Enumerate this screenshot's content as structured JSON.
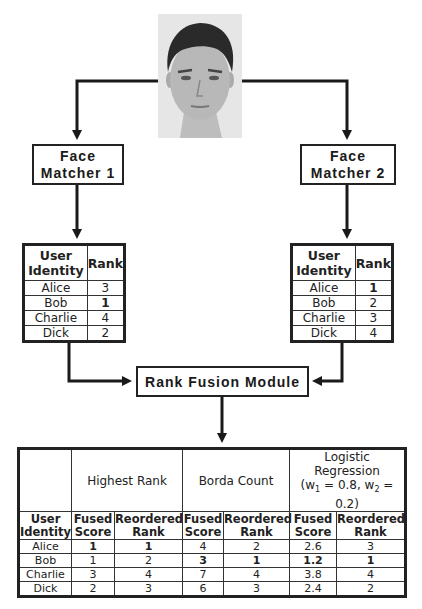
{
  "diagram": {
    "input_image": {
      "label": "face-photo",
      "description": "Grayscale frontal face photo of a young man"
    },
    "matchers": [
      {
        "line1": "Face",
        "line2": "Matcher 1"
      },
      {
        "line1": "Face",
        "line2": "Matcher 2"
      }
    ],
    "fusion_module": {
      "label": "Rank Fusion Module"
    },
    "matcher_tables": [
      {
        "headers": {
          "identity_line1": "User",
          "identity_line2": "Identity",
          "rank": "Rank"
        },
        "rows": [
          {
            "name": "Alice",
            "rank": "3"
          },
          {
            "name": "Bob",
            "rank": "1"
          },
          {
            "name": "Charlie",
            "rank": "4"
          },
          {
            "name": "Dick",
            "rank": "2"
          }
        ]
      },
      {
        "headers": {
          "identity_line1": "User",
          "identity_line2": "Identity",
          "rank": "Rank"
        },
        "rows": [
          {
            "name": "Alice",
            "rank": "1"
          },
          {
            "name": "Bob",
            "rank": "2"
          },
          {
            "name": "Charlie",
            "rank": "3"
          },
          {
            "name": "Dick",
            "rank": "4"
          }
        ]
      }
    ],
    "fusion_table": {
      "groups": [
        {
          "label": "Highest Rank"
        },
        {
          "label": "Borda Count"
        },
        {
          "label": "Logistic Regression",
          "weights_prefix": "(w",
          "w1_sub": "1",
          "w1_val": " = 0.8, w",
          "w2_sub": "2",
          "w2_val": " = 0.2)"
        }
      ],
      "subheaders": {
        "identity_line1": "User",
        "identity_line2": "Identity",
        "fused_line1": "Fused",
        "fused_line2": "Score",
        "reordered_line1": "Reordered",
        "reordered_line2": "Rank"
      },
      "rows": [
        {
          "name": "Alice",
          "hr_fused": "1",
          "hr_rank": "1",
          "bc_fused": "4",
          "bc_rank": "2",
          "lr_fused": "2.6",
          "lr_rank": "3"
        },
        {
          "name": "Bob",
          "hr_fused": "1",
          "hr_rank": "2",
          "bc_fused": "3",
          "bc_rank": "1",
          "lr_fused": "1.2",
          "lr_rank": "1"
        },
        {
          "name": "Charlie",
          "hr_fused": "3",
          "hr_rank": "4",
          "bc_fused": "7",
          "bc_rank": "4",
          "lr_fused": "3.8",
          "lr_rank": "4"
        },
        {
          "name": "Dick",
          "hr_fused": "2",
          "hr_rank": "3",
          "bc_fused": "6",
          "bc_rank": "3",
          "lr_fused": "2.4",
          "lr_rank": "2"
        }
      ]
    }
  }
}
